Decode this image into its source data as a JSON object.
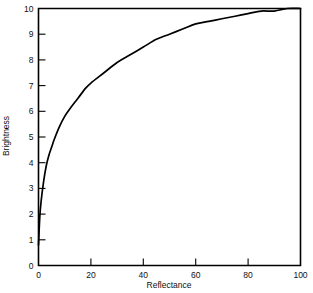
{
  "figure": {
    "background_color": "#ffffff",
    "line_color": "#000000"
  },
  "chart_data": {
    "type": "line",
    "title": "",
    "subtitle": "",
    "xlabel": "Reflectance",
    "ylabel": "Brightness",
    "xlim": [
      0,
      100
    ],
    "ylim": [
      0,
      10
    ],
    "grid": false,
    "legend": null,
    "x_ticks": [
      0,
      20,
      40,
      60,
      80,
      100
    ],
    "x_tick_labels": [
      "0",
      "20",
      "40",
      "60",
      "80",
      "100"
    ],
    "y_ticks": [
      0,
      1,
      2,
      3,
      4,
      5,
      6,
      7,
      8,
      9,
      10
    ],
    "y_tick_labels": [
      "0",
      "1",
      "2",
      "3",
      "4",
      "5",
      "6",
      "7",
      "8",
      "9",
      "10"
    ],
    "tick_direction": "in",
    "series": [
      {
        "name": "Brightness vs Reflectance",
        "color": "#000000",
        "x": [
          0,
          0.5,
          1,
          2,
          3,
          4,
          5,
          6,
          8,
          10,
          12,
          15,
          18,
          20,
          25,
          30,
          35,
          40,
          45,
          50,
          55,
          60,
          65,
          70,
          75,
          80,
          85,
          90,
          95,
          100
        ],
        "values": [
          0.8,
          1.9,
          2.5,
          3.3,
          3.9,
          4.3,
          4.6,
          4.9,
          5.4,
          5.8,
          6.1,
          6.5,
          6.9,
          7.1,
          7.5,
          7.9,
          8.2,
          8.5,
          8.8,
          9.0,
          9.2,
          9.4,
          9.5,
          9.6,
          9.7,
          9.8,
          9.9,
          9.9,
          10.0,
          10.0
        ]
      }
    ],
    "annotations": []
  },
  "axes": {
    "x_axis_name": "Reflectance",
    "y_axis_name": "Brightness"
  }
}
